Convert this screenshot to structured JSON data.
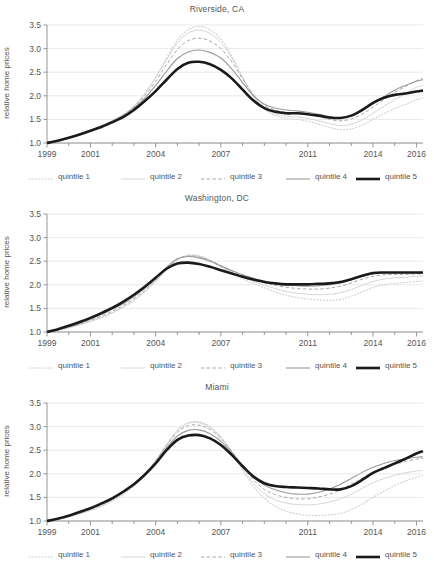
{
  "figure": {
    "ylabel": "relative home prices",
    "y_ticks": [
      "1.0",
      "1.5",
      "2.0",
      "2.5",
      "3.0",
      "3.5"
    ],
    "x_ticks": [
      "1999",
      "2001",
      "2004",
      "2007",
      "2011",
      "2014",
      "2016"
    ],
    "legend": [
      {
        "label": "quintile 1",
        "style": "dotted",
        "color": "#cfcfcf",
        "width": 1.1
      },
      {
        "label": "quintile 2",
        "style": "solid",
        "color": "#d6d6d6",
        "width": 1.0
      },
      {
        "label": "quintile 3",
        "style": "dashed",
        "color": "#a8a8a8",
        "width": 1.0
      },
      {
        "label": "quintile 4",
        "style": "solid",
        "color": "#9a9a9a",
        "width": 1.1
      },
      {
        "label": "quintile 5",
        "style": "solid",
        "color": "#1a1a1a",
        "width": 2.6
      }
    ]
  },
  "chart_data": [
    {
      "type": "line",
      "title": "Riverside, CA",
      "xlabel": "",
      "ylabel": "relative home prices",
      "xlim": [
        1999,
        2016.3
      ],
      "ylim": [
        1.0,
        3.5
      ],
      "grid": true,
      "legend_position": "below",
      "x": [
        1999,
        1999.5,
        2000,
        2000.5,
        2001,
        2001.5,
        2002,
        2002.5,
        2003,
        2003.5,
        2004,
        2004.5,
        2005,
        2005.5,
        2006,
        2006.5,
        2007,
        2007.5,
        2008,
        2008.5,
        2009,
        2009.5,
        2010,
        2010.5,
        2011,
        2011.5,
        2012,
        2012.5,
        2013,
        2013.5,
        2014,
        2014.5,
        2015,
        2015.5,
        2016,
        2016.3
      ],
      "series": [
        {
          "name": "quintile 1",
          "values": [
            1.0,
            1.05,
            1.11,
            1.19,
            1.27,
            1.36,
            1.47,
            1.6,
            1.78,
            2.05,
            2.4,
            2.8,
            3.18,
            3.4,
            3.47,
            3.4,
            3.2,
            2.85,
            2.4,
            2.0,
            1.72,
            1.58,
            1.52,
            1.5,
            1.46,
            1.4,
            1.33,
            1.28,
            1.3,
            1.38,
            1.5,
            1.62,
            1.73,
            1.82,
            1.92,
            1.95
          ]
        },
        {
          "name": "quintile 2",
          "values": [
            1.0,
            1.05,
            1.11,
            1.19,
            1.27,
            1.36,
            1.47,
            1.6,
            1.78,
            2.04,
            2.38,
            2.76,
            3.12,
            3.33,
            3.39,
            3.32,
            3.13,
            2.8,
            2.38,
            2.0,
            1.74,
            1.62,
            1.57,
            1.55,
            1.52,
            1.47,
            1.41,
            1.37,
            1.4,
            1.49,
            1.63,
            1.78,
            1.92,
            2.05,
            2.18,
            2.22
          ]
        },
        {
          "name": "quintile 3",
          "values": [
            1.0,
            1.05,
            1.11,
            1.19,
            1.27,
            1.36,
            1.47,
            1.59,
            1.76,
            2.0,
            2.31,
            2.66,
            2.98,
            3.17,
            3.22,
            3.16,
            3.0,
            2.72,
            2.36,
            2.03,
            1.8,
            1.7,
            1.65,
            1.63,
            1.6,
            1.56,
            1.5,
            1.47,
            1.51,
            1.61,
            1.76,
            1.92,
            2.07,
            2.2,
            2.32,
            2.36
          ]
        },
        {
          "name": "quintile 4",
          "values": [
            1.0,
            1.05,
            1.11,
            1.19,
            1.27,
            1.36,
            1.46,
            1.58,
            1.74,
            1.95,
            2.22,
            2.52,
            2.79,
            2.93,
            2.97,
            2.92,
            2.8,
            2.57,
            2.28,
            2.0,
            1.82,
            1.74,
            1.7,
            1.68,
            1.65,
            1.61,
            1.56,
            1.53,
            1.57,
            1.68,
            1.83,
            1.98,
            2.12,
            2.22,
            2.31,
            2.34
          ]
        },
        {
          "name": "quintile 5",
          "values": [
            1.0,
            1.05,
            1.11,
            1.18,
            1.26,
            1.34,
            1.44,
            1.55,
            1.7,
            1.89,
            2.1,
            2.34,
            2.57,
            2.7,
            2.72,
            2.67,
            2.55,
            2.37,
            2.13,
            1.9,
            1.74,
            1.66,
            1.63,
            1.63,
            1.61,
            1.58,
            1.54,
            1.53,
            1.58,
            1.7,
            1.85,
            1.96,
            2.02,
            2.05,
            2.09,
            2.11
          ]
        }
      ]
    },
    {
      "type": "line",
      "title": "Washington, DC",
      "xlabel": "",
      "ylabel": "relative home prices",
      "xlim": [
        1999,
        2016.3
      ],
      "ylim": [
        1.0,
        3.5
      ],
      "grid": true,
      "legend_position": "below",
      "x": [
        1999,
        1999.5,
        2000,
        2000.5,
        2001,
        2001.5,
        2002,
        2002.5,
        2003,
        2003.5,
        2004,
        2004.5,
        2005,
        2005.5,
        2006,
        2006.5,
        2007,
        2007.5,
        2008,
        2008.5,
        2009,
        2009.5,
        2010,
        2010.5,
        2011,
        2011.5,
        2012,
        2012.5,
        2013,
        2013.5,
        2014,
        2014.5,
        2015,
        2015.5,
        2016,
        2016.3
      ],
      "series": [
        {
          "name": "quintile 1",
          "values": [
            1.0,
            1.04,
            1.09,
            1.15,
            1.22,
            1.3,
            1.4,
            1.52,
            1.67,
            1.85,
            2.07,
            2.32,
            2.53,
            2.63,
            2.62,
            2.52,
            2.38,
            2.24,
            2.12,
            2.03,
            1.94,
            1.85,
            1.78,
            1.73,
            1.7,
            1.68,
            1.67,
            1.69,
            1.76,
            1.85,
            1.94,
            2.0,
            2.03,
            2.05,
            2.07,
            2.08
          ]
        },
        {
          "name": "quintile 2",
          "values": [
            1.0,
            1.04,
            1.09,
            1.16,
            1.23,
            1.31,
            1.41,
            1.53,
            1.68,
            1.86,
            2.08,
            2.33,
            2.54,
            2.62,
            2.6,
            2.52,
            2.39,
            2.27,
            2.16,
            2.07,
            1.99,
            1.92,
            1.86,
            1.82,
            1.8,
            1.79,
            1.8,
            1.83,
            1.9,
            1.99,
            2.07,
            2.12,
            2.15,
            2.16,
            2.18,
            2.18
          ]
        },
        {
          "name": "quintile 3",
          "values": [
            1.0,
            1.04,
            1.1,
            1.17,
            1.25,
            1.34,
            1.44,
            1.56,
            1.71,
            1.89,
            2.1,
            2.34,
            2.54,
            2.61,
            2.59,
            2.52,
            2.41,
            2.3,
            2.2,
            2.12,
            2.05,
            1.99,
            1.95,
            1.92,
            1.91,
            1.91,
            1.93,
            1.97,
            2.04,
            2.12,
            2.18,
            2.21,
            2.22,
            2.22,
            2.23,
            2.23
          ]
        },
        {
          "name": "quintile 4",
          "values": [
            1.0,
            1.05,
            1.11,
            1.18,
            1.27,
            1.37,
            1.48,
            1.6,
            1.75,
            1.93,
            2.14,
            2.37,
            2.55,
            2.6,
            2.57,
            2.5,
            2.4,
            2.3,
            2.21,
            2.14,
            2.08,
            2.03,
            2.0,
            1.98,
            1.97,
            1.98,
            2.0,
            2.04,
            2.11,
            2.18,
            2.23,
            2.25,
            2.25,
            2.25,
            2.25,
            2.25
          ]
        },
        {
          "name": "quintile 5",
          "values": [
            1.0,
            1.06,
            1.13,
            1.21,
            1.3,
            1.4,
            1.51,
            1.64,
            1.79,
            1.96,
            2.15,
            2.34,
            2.45,
            2.47,
            2.44,
            2.38,
            2.31,
            2.24,
            2.17,
            2.11,
            2.06,
            2.03,
            2.01,
            2.01,
            2.01,
            2.02,
            2.03,
            2.06,
            2.12,
            2.19,
            2.25,
            2.26,
            2.26,
            2.26,
            2.26,
            2.26
          ]
        }
      ]
    },
    {
      "type": "line",
      "title": "Miami",
      "xlabel": "",
      "ylabel": "relative home prices",
      "xlim": [
        1999,
        2016.3
      ],
      "ylim": [
        1.0,
        3.5
      ],
      "grid": true,
      "legend_position": "below",
      "x": [
        1999,
        1999.5,
        2000,
        2000.5,
        2001,
        2001.5,
        2002,
        2002.5,
        2003,
        2003.5,
        2004,
        2004.5,
        2005,
        2005.5,
        2006,
        2006.5,
        2007,
        2007.5,
        2008,
        2008.5,
        2009,
        2009.5,
        2010,
        2010.5,
        2011,
        2011.5,
        2012,
        2012.5,
        2013,
        2013.5,
        2014,
        2014.5,
        2015,
        2015.5,
        2016,
        2016.3
      ],
      "series": [
        {
          "name": "quintile 1",
          "values": [
            1.0,
            1.04,
            1.09,
            1.15,
            1.22,
            1.31,
            1.42,
            1.56,
            1.74,
            1.97,
            2.26,
            2.6,
            2.92,
            3.08,
            3.1,
            3.0,
            2.78,
            2.46,
            2.08,
            1.73,
            1.48,
            1.31,
            1.21,
            1.15,
            1.12,
            1.12,
            1.13,
            1.16,
            1.24,
            1.36,
            1.5,
            1.63,
            1.75,
            1.85,
            1.93,
            1.96
          ]
        },
        {
          "name": "quintile 2",
          "values": [
            1.0,
            1.04,
            1.09,
            1.16,
            1.23,
            1.32,
            1.44,
            1.58,
            1.76,
            1.99,
            2.28,
            2.62,
            2.92,
            3.07,
            3.08,
            2.98,
            2.77,
            2.47,
            2.12,
            1.8,
            1.58,
            1.45,
            1.38,
            1.35,
            1.34,
            1.36,
            1.4,
            1.47,
            1.57,
            1.69,
            1.81,
            1.9,
            1.97,
            2.02,
            2.06,
            2.07
          ]
        },
        {
          "name": "quintile 3",
          "values": [
            1.0,
            1.04,
            1.1,
            1.17,
            1.25,
            1.34,
            1.46,
            1.6,
            1.77,
            2.0,
            2.27,
            2.6,
            2.88,
            3.02,
            3.03,
            2.94,
            2.75,
            2.48,
            2.16,
            1.87,
            1.67,
            1.56,
            1.5,
            1.47,
            1.47,
            1.51,
            1.57,
            1.66,
            1.78,
            1.91,
            2.03,
            2.12,
            2.2,
            2.26,
            2.31,
            2.33
          ]
        },
        {
          "name": "quintile 4",
          "values": [
            1.0,
            1.05,
            1.11,
            1.18,
            1.26,
            1.36,
            1.47,
            1.61,
            1.78,
            1.99,
            2.25,
            2.55,
            2.8,
            2.92,
            2.93,
            2.85,
            2.69,
            2.45,
            2.18,
            1.93,
            1.76,
            1.66,
            1.6,
            1.57,
            1.57,
            1.61,
            1.68,
            1.78,
            1.9,
            2.03,
            2.14,
            2.22,
            2.28,
            2.32,
            2.35,
            2.36
          ]
        },
        {
          "name": "quintile 5",
          "values": [
            1.0,
            1.05,
            1.11,
            1.19,
            1.27,
            1.37,
            1.48,
            1.62,
            1.78,
            1.98,
            2.22,
            2.5,
            2.72,
            2.81,
            2.82,
            2.75,
            2.61,
            2.4,
            2.16,
            1.94,
            1.8,
            1.74,
            1.72,
            1.71,
            1.7,
            1.69,
            1.67,
            1.67,
            1.74,
            1.87,
            2.02,
            2.12,
            2.22,
            2.32,
            2.43,
            2.48
          ]
        }
      ]
    }
  ]
}
